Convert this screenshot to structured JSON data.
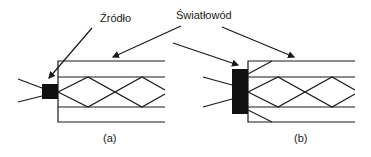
{
  "labels": {
    "source": "Źródło",
    "fiber": "Światłowód",
    "caption_a": "(a)",
    "caption_b": "(b)"
  },
  "colors": {
    "line": "#1a1a1a",
    "source_fill": "#111111",
    "background": "#ffffff"
  }
}
